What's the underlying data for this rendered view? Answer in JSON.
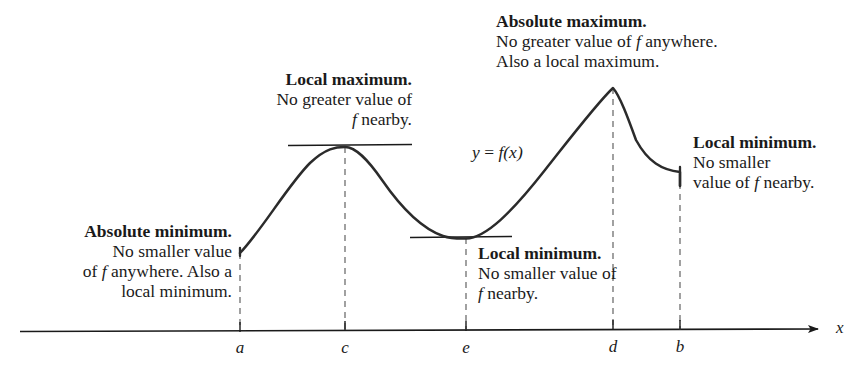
{
  "figure": {
    "axis": {
      "x_label": "x",
      "ticks": [
        {
          "id": "a",
          "label": "a",
          "x": 240
        },
        {
          "id": "c",
          "label": "c",
          "x": 345
        },
        {
          "id": "e",
          "label": "e",
          "x": 466
        },
        {
          "id": "d",
          "label": "d",
          "x": 613
        },
        {
          "id": "b",
          "label": "b",
          "x": 680
        }
      ]
    },
    "curve_label": {
      "y": "y",
      "equals": "=",
      "f": "f",
      "arg": "(x)",
      "full": "y = f(x)"
    },
    "annotations": [
      {
        "id": "absolute-minimum",
        "align": "right",
        "heading": "Absolute minimum.",
        "lines": [
          {
            "parts": [
              {
                "t": "No smaller value",
                "style": "normal"
              }
            ]
          },
          {
            "parts": [
              {
                "t": "of ",
                "style": "normal"
              },
              {
                "t": "f",
                "style": "italic"
              },
              {
                "t": " anywhere. Also a",
                "style": "normal"
              }
            ]
          },
          {
            "parts": [
              {
                "t": "local minimum.",
                "style": "normal"
              }
            ]
          }
        ]
      },
      {
        "id": "local-maximum",
        "align": "right",
        "heading": "Local maximum.",
        "lines": [
          {
            "parts": [
              {
                "t": "No greater value of",
                "style": "normal"
              }
            ]
          },
          {
            "parts": [
              {
                "t": "f",
                "style": "italic"
              },
              {
                "t": " nearby.",
                "style": "normal"
              }
            ]
          }
        ]
      },
      {
        "id": "absolute-maximum",
        "align": "left",
        "heading": "Absolute maximum.",
        "lines": [
          {
            "parts": [
              {
                "t": "No greater value of ",
                "style": "normal"
              },
              {
                "t": "f",
                "style": "italic"
              },
              {
                "t": " anywhere.",
                "style": "normal"
              }
            ]
          },
          {
            "parts": [
              {
                "t": "Also a local maximum.",
                "style": "normal"
              }
            ]
          }
        ]
      },
      {
        "id": "local-minimum-interior",
        "align": "left",
        "heading": "Local minimum.",
        "lines": [
          {
            "parts": [
              {
                "t": "No smaller value of",
                "style": "normal"
              }
            ]
          },
          {
            "parts": [
              {
                "t": "f",
                "style": "italic"
              },
              {
                "t": " nearby.",
                "style": "normal"
              }
            ]
          }
        ]
      },
      {
        "id": "local-minimum-endpoint",
        "align": "left",
        "heading": "Local minimum.",
        "lines": [
          {
            "parts": [
              {
                "t": "No smaller",
                "style": "normal"
              }
            ]
          },
          {
            "parts": [
              {
                "t": "value of ",
                "style": "normal"
              },
              {
                "t": "f",
                "style": "italic"
              },
              {
                "t": " nearby.",
                "style": "normal"
              }
            ]
          }
        ]
      }
    ]
  },
  "chart_data": {
    "type": "line",
    "xlabel": "x",
    "ylabel": "y = f(x)",
    "grid": false,
    "legend": "none",
    "xlim": [
      240,
      680
    ],
    "axis_pixel_y": 330,
    "categories": [
      "a",
      "c",
      "e",
      "d",
      "b"
    ],
    "critical_points": [
      {
        "label": "a",
        "x": 240,
        "pixel_y": 253,
        "kind": "absolute minimum (also local minimum)",
        "endpoint": true
      },
      {
        "label": "c",
        "x": 345,
        "pixel_y": 147,
        "kind": "local maximum",
        "endpoint": false
      },
      {
        "label": "e",
        "x": 466,
        "pixel_y": 238,
        "kind": "local minimum",
        "endpoint": false
      },
      {
        "label": "d",
        "x": 613,
        "pixel_y": 88,
        "kind": "absolute maximum (also local maximum)",
        "endpoint": false
      },
      {
        "label": "b",
        "x": 680,
        "pixel_y": 172,
        "kind": "local minimum",
        "endpoint": true
      }
    ],
    "tangent_segments": [
      {
        "at": "c",
        "x0": 288,
        "x1": 412,
        "pixel_y": 145
      },
      {
        "at": "e",
        "x0": 410,
        "x1": 512,
        "pixel_y": 237
      }
    ],
    "curve_path": "M240,253 C262,230 288,185 310,163 C326,148 336,147 345,147 C356,147 368,160 382,180 C400,206 420,228 443,236 C452,239 460,238.5 466,238.5 C486,238 512,212 545,170 C575,132 598,102 613,88 C620,96 628,118 636,140 C648,162 662,170 680,172 L680,186"
  }
}
